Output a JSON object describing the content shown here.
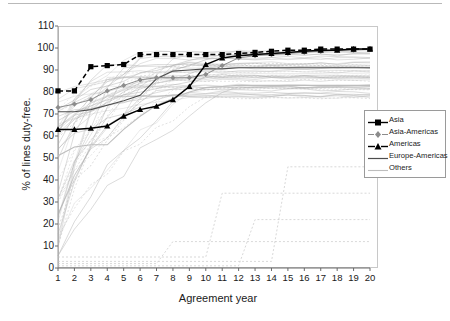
{
  "chart_data": {
    "type": "line",
    "title": "",
    "xlabel": "Agreement year",
    "ylabel": "% of lines duty-free.",
    "xlim": [
      1,
      20
    ],
    "ylim": [
      0,
      110
    ],
    "grid": false,
    "legend_position": "right-middle",
    "x": [
      1,
      2,
      3,
      4,
      5,
      6,
      7,
      8,
      9,
      10,
      11,
      12,
      13,
      14,
      15,
      16,
      17,
      18,
      19,
      20
    ],
    "xticklabels": [
      "1",
      "2",
      "3",
      "4",
      "5",
      "6",
      "7",
      "8",
      "9",
      "10",
      "11",
      "12",
      "13",
      "14",
      "15",
      "16",
      "17",
      "18",
      "19",
      "20"
    ],
    "yticklabels": [
      "0",
      "10",
      "20",
      "30",
      "40",
      "50",
      "60",
      "70",
      "80",
      "90",
      "100",
      "110"
    ],
    "yticks": [
      0,
      10,
      20,
      30,
      40,
      50,
      60,
      70,
      80,
      90,
      100,
      110
    ],
    "series": [
      {
        "name": "Asia",
        "marker": "square-filled",
        "linestyle": "dashed",
        "color": "#000000",
        "values": [
          80.5,
          80.5,
          91.5,
          92,
          92.5,
          97,
          97,
          97,
          97,
          97,
          97,
          97.5,
          98,
          98.5,
          99,
          99,
          99.5,
          99.5,
          99.5,
          99.5
        ]
      },
      {
        "name": "Asia-Americas",
        "marker": "diamond-small",
        "linestyle": "solid",
        "color": "#8c8c8c",
        "values": [
          73,
          74.5,
          76.5,
          80.5,
          83,
          85.5,
          86.5,
          86.5,
          86.5,
          88,
          92,
          95.5,
          96.5,
          97,
          97.5,
          98,
          98.5,
          99,
          99,
          99.5
        ]
      },
      {
        "name": "Americas",
        "marker": "triangle-filled",
        "linestyle": "solid",
        "color": "#000000",
        "values": [
          63,
          63,
          63.5,
          64.5,
          69,
          72,
          73.5,
          76.5,
          82.5,
          92.5,
          95.5,
          96.5,
          97,
          97.5,
          98,
          98.5,
          99,
          99,
          99.5,
          99.5
        ]
      },
      {
        "name": "Europe-Americas",
        "marker": "none",
        "linestyle": "solid",
        "color": "#4d4d4d",
        "values": [
          71,
          71,
          72,
          74,
          76,
          78.5,
          86,
          89.5,
          90,
          90.5,
          90.5,
          91,
          91,
          91,
          91,
          91,
          91,
          91,
          91,
          91
        ]
      },
      {
        "name": "Others",
        "marker": "none",
        "linestyle": "solid",
        "color": "#bdbdbd",
        "note": "many faint background lines",
        "values": [
          51,
          55,
          56,
          56,
          63,
          69,
          74,
          77,
          80,
          82,
          82.5,
          83,
          83,
          83,
          83,
          83,
          83,
          83,
          83,
          83
        ]
      }
    ]
  },
  "legend": {
    "items": [
      {
        "label": "Asia"
      },
      {
        "label": "Asia-Americas"
      },
      {
        "label": "Americas"
      },
      {
        "label": "Europe-Americas"
      },
      {
        "label": "Others"
      }
    ]
  }
}
